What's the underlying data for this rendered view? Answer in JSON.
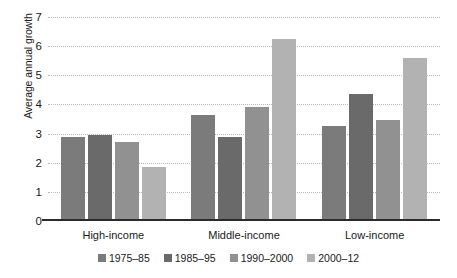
{
  "chart_data": {
    "type": "bar",
    "title": "",
    "subtitle": "",
    "xlabel": "",
    "ylabel": "Average annual growth",
    "categories": [
      "High-income",
      "Middle-income",
      "Low-income"
    ],
    "series": [
      {
        "name": "1975–85",
        "color": "#7b7b7b",
        "values": [
          2.9,
          3.65,
          3.25
        ]
      },
      {
        "name": "1985–95",
        "color": "#6a6a6a",
        "values": [
          2.95,
          2.9,
          4.35
        ]
      },
      {
        "name": "1990–2000",
        "color": "#919191",
        "values": [
          2.7,
          3.9,
          3.45
        ]
      },
      {
        "name": "2000–12",
        "color": "#b2b2b2",
        "values": [
          1.85,
          6.25,
          5.6
        ]
      }
    ],
    "ylim": [
      0,
      7
    ],
    "ytick_values": [
      0,
      1,
      2,
      3,
      4,
      5,
      6,
      7
    ],
    "ytick_labels": [
      "0",
      "1",
      "2",
      "3",
      "4",
      "5",
      "6",
      "7"
    ],
    "grid": true,
    "grid_axis": "y",
    "grid_style": "dotted",
    "grid_color": "#b9b9b9",
    "legend_position": "bottom",
    "axis_color": "#2b2b2b",
    "background_color": "#ffffff"
  }
}
